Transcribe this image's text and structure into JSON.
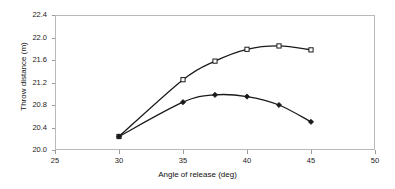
{
  "chart_data": {
    "type": "line",
    "title": "",
    "xlabel": "Angle of release (deg)",
    "ylabel": "Throw distance (m)",
    "xlim": [
      25,
      50
    ],
    "ylim": [
      20.0,
      22.4
    ],
    "xticks": [
      25,
      30,
      35,
      40,
      45,
      50
    ],
    "yticks": [
      20.0,
      20.4,
      20.8,
      21.2,
      21.6,
      22.0,
      22.4
    ],
    "xtick_labels": [
      "25",
      "30",
      "35",
      "40",
      "45",
      "50"
    ],
    "ytick_labels": [
      "20.0",
      "20.4",
      "20.8",
      "21.2",
      "21.6",
      "22.0",
      "22.4"
    ],
    "grid": false,
    "legend": "none",
    "series": [
      {
        "name": "upper-series",
        "marker": "square",
        "marker_fill": "#ffffff",
        "marker_stroke": "#1a1a1a",
        "line_color": "#1a1a1a",
        "x": [
          30,
          35,
          37.5,
          40,
          42.5,
          45
        ],
        "values": [
          20.24,
          21.25,
          21.58,
          21.79,
          21.85,
          21.78
        ]
      },
      {
        "name": "lower-series",
        "marker": "diamond",
        "marker_fill": "#1a1a1a",
        "marker_stroke": "#1a1a1a",
        "line_color": "#1a1a1a",
        "x": [
          30,
          35,
          37.5,
          40,
          42.5,
          45
        ],
        "values": [
          20.24,
          20.85,
          20.98,
          20.95,
          20.8,
          20.5
        ]
      }
    ]
  },
  "axes": {
    "x_title": "Angle of release (deg)",
    "y_title": "Throw distance (m)"
  }
}
